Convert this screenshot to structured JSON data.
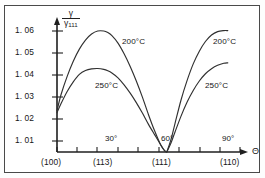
{
  "figure": {
    "background": "#ffffff",
    "border_color": "#4a4a4a",
    "axis_color": "#1f1f1f",
    "curve_color": "#303030"
  },
  "axes": {
    "y_title_numerator": "γ",
    "y_title_denominator": "γ",
    "y_title_denominator_sub": "111",
    "x_axis_symbol": "Θ"
  },
  "chart_data": {
    "type": "line",
    "title": "",
    "subtitle": "",
    "xlabel": "Θ",
    "ylabel": "γ/γ111",
    "xlim": [
      0,
      90
    ],
    "ylim": [
      1.0,
      1.065
    ],
    "grid": false,
    "legend_position": "inline-annotations",
    "y_ticks": [
      1.01,
      1.02,
      1.03,
      1.04,
      1.05,
      1.06
    ],
    "y_tick_labels": [
      "1. 01",
      "1. 02",
      "1. 03",
      "1. 04",
      "1. 05",
      "1. 06"
    ],
    "x_ticks": [
      0,
      10,
      20,
      30,
      40,
      50,
      60,
      70,
      80,
      90
    ],
    "x_tick_labels_major": [
      "30°",
      "60°",
      "90°"
    ],
    "x_tick_label_positions": [
      30,
      60,
      90
    ],
    "x_crystal_labels": [
      "(100)",
      "(113)",
      "(111)",
      "(110)"
    ],
    "x_crystal_positions": [
      0,
      25,
      54,
      84
    ],
    "annotations": [
      {
        "text": "200°C",
        "x": 34,
        "y": 1.0525
      },
      {
        "text": "250°C",
        "x": 26,
        "y": 1.0335
      },
      {
        "text": "200°C",
        "x": 78,
        "y": 1.0525
      },
      {
        "text": "250°C",
        "x": 77,
        "y": 1.0335
      }
    ],
    "series": [
      {
        "name": "200°C",
        "x": [
          0,
          2,
          5,
          8,
          11,
          14,
          17,
          20,
          23,
          25,
          27,
          30,
          33,
          36,
          39,
          42,
          45,
          48,
          51,
          53,
          54,
          56,
          58,
          61,
          64,
          67,
          70,
          73,
          76,
          79,
          82,
          84
        ],
        "y": [
          1.0205,
          1.0285,
          1.0375,
          1.045,
          1.051,
          1.0555,
          1.0585,
          1.06,
          1.06,
          1.0592,
          1.0577,
          1.054,
          1.0487,
          1.0424,
          1.0352,
          1.0272,
          1.0185,
          1.0105,
          1.0035,
          1.0005,
          1.0,
          1.006,
          1.014,
          1.0258,
          1.0355,
          1.0437,
          1.05,
          1.0548,
          1.058,
          1.0597,
          1.0602,
          1.0602
        ]
      },
      {
        "name": "250°C",
        "x": [
          0,
          2,
          5,
          8,
          11,
          14,
          17,
          20,
          23,
          25,
          27,
          30,
          33,
          36,
          39,
          42,
          45,
          48,
          51,
          53,
          54,
          56,
          58,
          61,
          64,
          67,
          70,
          73,
          76,
          79,
          82,
          84
        ],
        "y": [
          1.0195,
          1.024,
          1.03,
          1.0348,
          1.0385,
          1.0404,
          1.0412,
          1.0414,
          1.041,
          1.0403,
          1.0392,
          1.0368,
          1.0333,
          1.0292,
          1.0245,
          1.0193,
          1.0137,
          1.0086,
          1.0036,
          1.0006,
          1.0,
          1.0043,
          1.0098,
          1.0178,
          1.0248,
          1.0305,
          1.0352,
          1.0388,
          1.0413,
          1.043,
          1.044,
          1.0442
        ]
      }
    ]
  },
  "labels": {
    "y_tick_1_06": "1. 06",
    "y_tick_1_05": "1. 05",
    "y_tick_1_04": "1. 04",
    "y_tick_1_03": "1. 03",
    "y_tick_1_02": "1. 02",
    "y_tick_1_01": "1. 01",
    "angle_30": "30°",
    "angle_60": "60°",
    "angle_90": "90°",
    "crystal_100": "(100)",
    "crystal_113": "(113)",
    "crystal_111": "(111)",
    "crystal_110": "(110)",
    "series_left_200": "200°C",
    "series_left_250": "250°C",
    "series_right_200": "200°C",
    "series_right_250": "250°C",
    "theta": "Θ",
    "gamma": "γ",
    "gamma_sub": "111"
  }
}
